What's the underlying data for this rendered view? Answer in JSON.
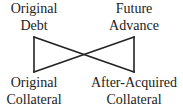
{
  "diagram": {
    "nodes": {
      "top_left": {
        "line1": "Original",
        "line2": "Debt"
      },
      "top_right": {
        "line1": "Future",
        "line2": "Advance"
      },
      "bottom_left": {
        "line1": "Original",
        "line2": "Collateral"
      },
      "bottom_right": {
        "line1": "After-Acquired",
        "line2": "Collateral"
      }
    },
    "edges": [
      {
        "from": "top_left",
        "to": "bottom_left"
      },
      {
        "from": "top_right",
        "to": "bottom_right"
      },
      {
        "from": "top_left",
        "to": "bottom_right"
      },
      {
        "from": "top_right",
        "to": "bottom_left"
      }
    ],
    "line_color": "#222222"
  }
}
